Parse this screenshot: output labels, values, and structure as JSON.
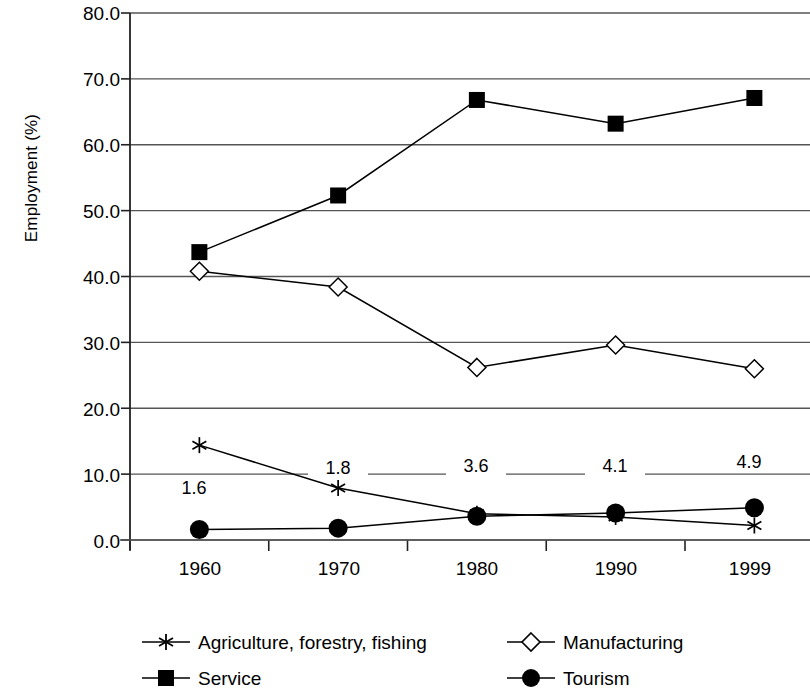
{
  "chart_data": {
    "type": "line",
    "title": "",
    "xlabel": "",
    "ylabel": "Employment (%)",
    "categories": [
      "1960",
      "1970",
      "1980",
      "1990",
      "1999"
    ],
    "ylim": [
      0.0,
      80.0
    ],
    "yticks": [
      "0.0",
      "10.0",
      "20.0",
      "30.0",
      "40.0",
      "50.0",
      "60.0",
      "70.0",
      "80.0"
    ],
    "ytick_values": [
      0.0,
      10.0,
      20.0,
      30.0,
      40.0,
      50.0,
      60.0,
      70.0,
      80.0
    ],
    "grid": true,
    "legend_position": "bottom",
    "series": [
      {
        "name": "Agriculture, forestry, fishing",
        "marker": "asterisk",
        "values": [
          14.4,
          7.9,
          4.0,
          3.5,
          2.2
        ]
      },
      {
        "name": "Manufacturing",
        "marker": "open-diamond",
        "values": [
          40.8,
          38.4,
          26.2,
          29.6,
          26.0
        ]
      },
      {
        "name": "Service",
        "marker": "filled-square",
        "values": [
          43.7,
          52.3,
          66.8,
          63.2,
          67.1
        ]
      },
      {
        "name": "Tourism",
        "marker": "filled-circle",
        "values": [
          1.6,
          1.8,
          3.6,
          4.1,
          4.9
        ],
        "data_labels": [
          "1.6",
          "1.8",
          "3.6",
          "4.1",
          "4.9"
        ]
      }
    ],
    "colors": {
      "line": "#000000",
      "grid": "#555555",
      "axis": "#222222",
      "background": "#ffffff"
    }
  },
  "axis": {
    "y_label": "Employment (%)",
    "y_ticks": [
      "80.0",
      "70.0",
      "60.0",
      "50.0",
      "40.0",
      "30.0",
      "20.0",
      "10.0",
      "0.0"
    ],
    "x_ticks": [
      "1960",
      "1970",
      "1980",
      "1990",
      "1999"
    ]
  },
  "data_labels": {
    "tourism": [
      "1.6",
      "1.8",
      "3.6",
      "4.1",
      "4.9"
    ]
  },
  "legend": {
    "items": [
      {
        "label": "Agriculture, forestry, fishing",
        "marker": "asterisk"
      },
      {
        "label": "Manufacturing",
        "marker": "open-diamond"
      },
      {
        "label": "Service",
        "marker": "filled-square"
      },
      {
        "label": "Tourism",
        "marker": "filled-circle"
      }
    ]
  }
}
